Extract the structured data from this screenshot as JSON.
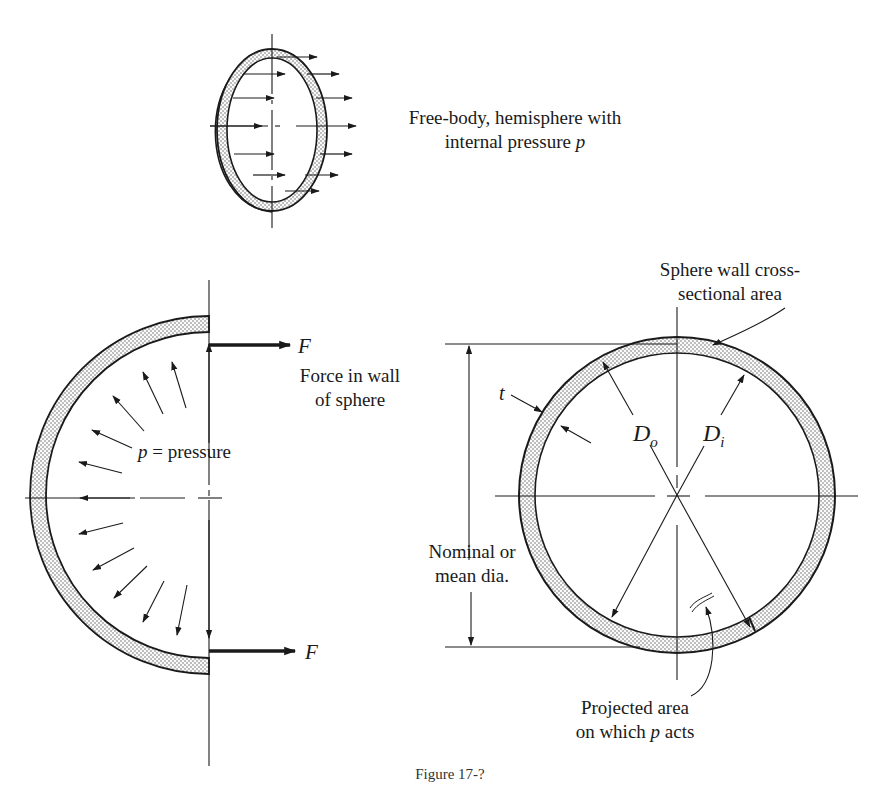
{
  "figure": {
    "caption_partial": "Figure 17-?",
    "top_diagram": {
      "label_line1": "Free-body, hemisphere with",
      "label_line2_prefix": "internal pressure ",
      "label_line2_var": "p"
    },
    "left_diagram": {
      "force_symbol": "F",
      "force_label_line1": "Force in wall",
      "force_label_line2": "of sphere",
      "pressure_var": "p",
      "pressure_label": " = pressure"
    },
    "right_diagram": {
      "wall_label_line1": "Sphere wall cross-",
      "wall_label_line2": "sectional area",
      "thickness_symbol": "t",
      "outer_dia_symbol": "D",
      "outer_dia_sub": "o",
      "inner_dia_symbol": "D",
      "inner_dia_sub": "i",
      "nominal_line1": "Nominal or",
      "nominal_line2": "mean dia.",
      "projected_line1": "Projected area",
      "projected_line2_prefix": "on which ",
      "projected_line2_var": "p",
      "projected_line2_suffix": " acts"
    }
  },
  "colors": {
    "ink": "#1a1a1a",
    "background": "#ffffff",
    "stipple": "#555555"
  }
}
